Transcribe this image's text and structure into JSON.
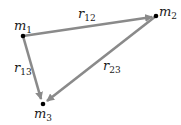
{
  "diagram": {
    "title": "",
    "masses": [
      {
        "id": "m1",
        "label": "m",
        "sub": "1"
      },
      {
        "id": "m2",
        "label": "m",
        "sub": "2"
      },
      {
        "id": "m3",
        "label": "m",
        "sub": "3"
      }
    ],
    "vectors": [
      {
        "id": "r12",
        "label": "r",
        "sub": "12",
        "from": "m1",
        "to": "m2"
      },
      {
        "id": "r13",
        "label": "r",
        "sub": "13",
        "from": "m1",
        "to": "m3"
      },
      {
        "id": "r23",
        "label": "r",
        "sub": "23",
        "from": "m2",
        "to": "m3"
      }
    ],
    "colors": {
      "arrow": "#8a8a8a",
      "point": "#000000",
      "text": "#1a1a1a"
    }
  }
}
